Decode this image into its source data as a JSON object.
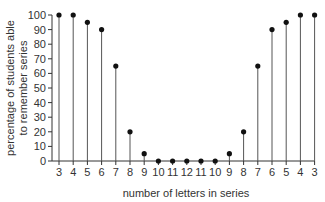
{
  "chart_data": {
    "type": "stem",
    "title": "",
    "xlabel": "number of letters in series",
    "ylabel_lines": [
      "percentage of students able",
      "to remember series"
    ],
    "ylabel": "percentage of students able to remember series",
    "categories": [
      "3",
      "4",
      "5",
      "6",
      "7",
      "8",
      "9",
      "10",
      "11",
      "12",
      "11",
      "10",
      "9",
      "8",
      "7",
      "6",
      "5",
      "4",
      "3"
    ],
    "values": [
      100,
      100,
      95,
      90,
      65,
      20,
      5,
      0,
      0,
      0,
      0,
      0,
      5,
      20,
      65,
      90,
      95,
      100,
      100
    ],
    "ylim": [
      0,
      100
    ],
    "yticks": [
      0,
      10,
      20,
      30,
      40,
      50,
      60,
      70,
      80,
      90,
      100
    ],
    "grid": false,
    "legend": null,
    "colors": {
      "stem": "#555555",
      "marker": "#111111",
      "axis": "#333333"
    }
  }
}
